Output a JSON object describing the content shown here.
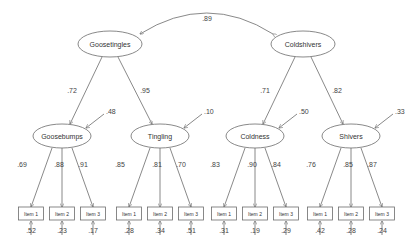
{
  "diagram": {
    "type": "structural-equation-model",
    "correlation": {
      "from": "Goosetingles",
      "to": "Coldshivers",
      "value": ".89"
    },
    "second_order": [
      {
        "name": "Goosetingles",
        "cx": 110,
        "cy": 44,
        "loadings": [
          {
            "to": 0,
            "value": ".72"
          },
          {
            "to": 1,
            "value": ".95"
          }
        ]
      },
      {
        "name": "Coldshivers",
        "cx": 303,
        "cy": 44,
        "loadings": [
          {
            "to": 2,
            "value": ".71"
          },
          {
            "to": 3,
            "value": ".82"
          }
        ]
      }
    ],
    "first_order": [
      {
        "name": "Goosebumps",
        "cx": 62,
        "cy": 136,
        "residual": ".48",
        "items": [
          {
            "label": "Item 1",
            "loading": ".69",
            "error": ".52"
          },
          {
            "label": "Item 2",
            "loading": ".88",
            "error": ".23"
          },
          {
            "label": "Item 3",
            "loading": ".91",
            "error": ".17"
          }
        ]
      },
      {
        "name": "Tingling",
        "cx": 160,
        "cy": 136,
        "residual": ".10",
        "items": [
          {
            "label": "Item 1",
            "loading": ".85",
            "error": ".28"
          },
          {
            "label": "Item 2",
            "loading": ".81",
            "error": ".34"
          },
          {
            "label": "Item 3",
            "loading": ".70",
            "error": ".51"
          }
        ]
      },
      {
        "name": "Coldness",
        "cx": 255,
        "cy": 136,
        "residual": ".50",
        "items": [
          {
            "label": "Item 1",
            "loading": ".83",
            "error": ".31"
          },
          {
            "label": "Item 2",
            "loading": ".90",
            "error": ".19"
          },
          {
            "label": "Item 3",
            "loading": ".84",
            "error": ".29"
          }
        ]
      },
      {
        "name": "Shivers",
        "cx": 351,
        "cy": 136,
        "residual": ".33",
        "items": [
          {
            "label": "Item 1",
            "loading": ".76",
            "error": ".42"
          },
          {
            "label": "Item 2",
            "loading": ".85",
            "error": ".28"
          },
          {
            "label": "Item 3",
            "loading": ".87",
            "error": ".24"
          }
        ]
      }
    ]
  }
}
